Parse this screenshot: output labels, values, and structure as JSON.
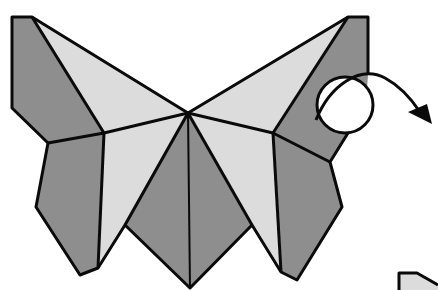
{
  "diagram": {
    "colors": {
      "dark_paper": "#8e8e8e",
      "light_paper": "#dcdcdc",
      "line": "#0a0a0a",
      "background": "#ffffff"
    },
    "annotations": [
      {
        "type": "rotate-circle-arrow",
        "meaning": "turn over / rotate",
        "position": "right wing"
      }
    ],
    "parts": [
      "left-upper-wing",
      "left-lower-wing",
      "center-body",
      "right-upper-wing",
      "right-lower-wing",
      "next-step-partial"
    ]
  }
}
